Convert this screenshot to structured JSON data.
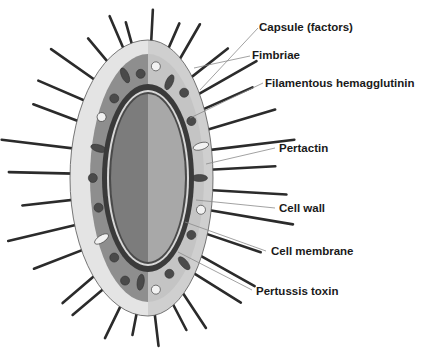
{
  "diagram": {
    "labels": [
      {
        "id": "capsule",
        "text": "Capsule (factors)"
      },
      {
        "id": "fimbriae",
        "text": "Fimbriae"
      },
      {
        "id": "fha",
        "text": "Filamentous hemagglutinin"
      },
      {
        "id": "pertactin",
        "text": "Pertactin"
      },
      {
        "id": "cell-wall",
        "text": "Cell wall"
      },
      {
        "id": "cell-membrane",
        "text": "Cell membrane"
      },
      {
        "id": "pertussis-toxin",
        "text": "Pertussis toxin"
      }
    ],
    "colors": {
      "capsule_outer_light": "#e4e4e4",
      "capsule_outer_dark": "#b9b9b9",
      "periplasm_light": "#c4c4c4",
      "periplasm_dark": "#8e8e8e",
      "wall": "#3a3a3a",
      "cytoplasm_light": "#a8a8a8",
      "cytoplasm_dark": "#7c7c7c",
      "spike": "#2b2b2b",
      "leader": "#8a8a8a"
    }
  }
}
